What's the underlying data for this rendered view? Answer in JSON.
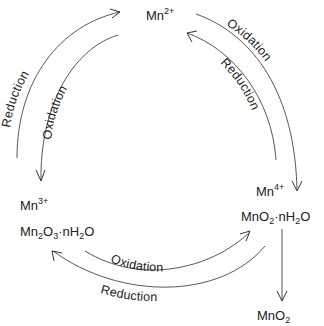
{
  "diagram": {
    "type": "cycle",
    "nodes": {
      "mn2": {
        "base": "Mn",
        "sup": "2+"
      },
      "mn3": {
        "base": "Mn",
        "sup": "3+",
        "compound": [
          "Mn",
          "2",
          "O",
          "3",
          "·nH",
          "2",
          "O"
        ]
      },
      "mn4": {
        "base": "Mn",
        "sup": "4+",
        "compound": [
          "MnO",
          "2",
          "·nH",
          "2",
          "O"
        ]
      },
      "mno2": {
        "base": "MnO",
        "sub": "2"
      }
    },
    "edges": [
      {
        "from": "Mn3+",
        "to": "Mn2+",
        "label": "Reduction"
      },
      {
        "from": "Mn2+",
        "to": "Mn3+",
        "label": "Oxidation"
      },
      {
        "from": "Mn2+",
        "to": "Mn4+",
        "label": "Oxidation"
      },
      {
        "from": "Mn4+",
        "to": "Mn2+",
        "label": "Reduction"
      },
      {
        "from": "Mn3+",
        "to": "Mn4+",
        "label": "Oxidation"
      },
      {
        "from": "Mn4+",
        "to": "Mn3+",
        "label": "Reduction"
      },
      {
        "from": "MnO2·nH2O",
        "to": "MnO2",
        "label": ""
      }
    ],
    "labels": {
      "left_outer": "Reduction",
      "left_inner": "Oxidation",
      "right_outer": "Oxidation",
      "right_inner": "Reduction",
      "bottom_inner": "Oxidation",
      "bottom_outer": "Reduction"
    }
  }
}
